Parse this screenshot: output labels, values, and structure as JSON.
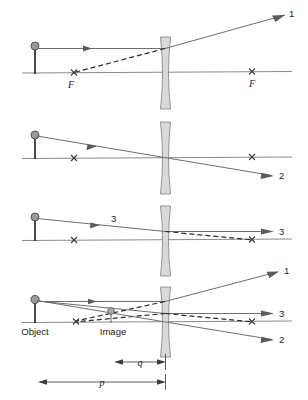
{
  "figure": {
    "colors": {
      "ray": "#6e6e6e",
      "axis": "#8a8a8a",
      "dashed_virtual_ray": "#2b2b2b",
      "lens_fill": "#d9d9d9",
      "object": "#9a9a9a",
      "background": "#ffffff"
    }
  },
  "panels": [
    {
      "id": "panel-1",
      "ray_label": "1",
      "focal_labels": [
        "F",
        "F"
      ],
      "has_dashed_ray": true,
      "note": "Ray parallel to axis refracts as if coming from near focal point"
    },
    {
      "id": "panel-2",
      "ray_label": "2",
      "focal_labels": [
        "",
        ""
      ],
      "has_dashed_ray": false,
      "note": "Ray through lens center passes undeviated"
    },
    {
      "id": "panel-3",
      "ray_label_incident": "3",
      "ray_label": "3",
      "focal_labels": [
        "",
        ""
      ],
      "has_dashed_ray": true,
      "note": "Ray aimed at far focal point emerges parallel to axis"
    },
    {
      "id": "panel-4",
      "ray_labels": [
        "1",
        "3",
        "2"
      ],
      "object_label": "Object",
      "image_label": "Image",
      "dimension_labels": {
        "image_distance": "q",
        "object_distance": "p"
      },
      "note": "All three rays combined locating the virtual upright image"
    }
  ],
  "annotations": {
    "focal_point_symbol": "x-mark",
    "object_marker": "ball-on-stick",
    "image_marker": "small-ball-on-stick",
    "lens_type": "concave-diverging-lens"
  }
}
